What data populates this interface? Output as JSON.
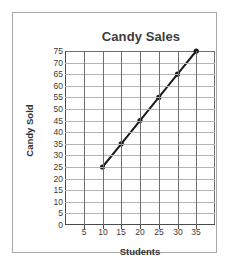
{
  "chart_data": {
    "type": "line",
    "title": "Candy Sales",
    "xlabel": "Students",
    "ylabel": "Candy Sold",
    "x": [
      10,
      15,
      20,
      25,
      30,
      35
    ],
    "values": [
      25,
      35,
      45,
      55,
      65,
      75
    ],
    "series": [
      {
        "name": "Candy Sold",
        "x": [
          10,
          15,
          20,
          25,
          30,
          35
        ],
        "values": [
          25,
          35,
          45,
          55,
          65,
          75
        ]
      }
    ],
    "xlim": [
      0,
      40
    ],
    "ylim": [
      0,
      75
    ],
    "xticks": [
      5,
      10,
      15,
      20,
      25,
      30,
      35
    ],
    "yticks": [
      0,
      5,
      10,
      15,
      20,
      25,
      30,
      35,
      40,
      45,
      50,
      55,
      60,
      65,
      70,
      75
    ],
    "xtick_labels": [
      "5",
      "10",
      "15",
      "20",
      "25",
      "30",
      "35"
    ],
    "ytick_labels": [
      "0",
      "5",
      "10",
      "15",
      "20",
      "25",
      "30",
      "35",
      "40",
      "45",
      "50",
      "55",
      "60",
      "65",
      "70",
      "75"
    ],
    "grid": true,
    "legend": null,
    "marker": "filled-circle",
    "line_color": "#1a1a1a",
    "marker_color": "#1a1a1a",
    "grid_color_horizontal": "#b4b4b4",
    "grid_color_vertical": "#6e6e6e",
    "title_color": "#3c3c3c",
    "axis_label_color": "#333333",
    "tick_label_color": "#3a3a3a",
    "background_color": "#ffffff",
    "frame_color": "#a8a8a8"
  }
}
